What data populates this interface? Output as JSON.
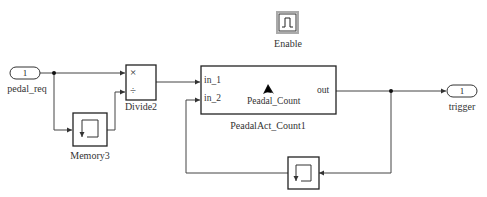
{
  "diagram": {
    "type": "simulink-model",
    "blocks": {
      "inport": {
        "number": "1",
        "name": "pedal_req"
      },
      "memory_top": {
        "name": "Memory3",
        "icon": "memory-icon"
      },
      "divide": {
        "name": "Divide2",
        "op1": "×",
        "op2": "÷"
      },
      "subsystem": {
        "name": "PeadalAct_Count1",
        "inner_name": "Peadal_Count",
        "inputs": [
          "in_1",
          "in_2"
        ],
        "output": "out",
        "icon": "stateflow-chart-icon"
      },
      "enable": {
        "name": "Enable",
        "icon": "enable-pulse-icon"
      },
      "outport": {
        "number": "1",
        "name": "trigger"
      },
      "memory_bottom": {
        "name": "",
        "icon": "memory-icon"
      }
    },
    "connections": [
      "pedal_req -> Divide2.in1",
      "pedal_req -> Memory3 -> Divide2.in2",
      "Divide2 -> PeadalAct_Count1.in_1",
      "PeadalAct_Count1.out -> trigger",
      "PeadalAct_Count1.out -> Memory -> PeadalAct_Count1.in_2"
    ]
  }
}
